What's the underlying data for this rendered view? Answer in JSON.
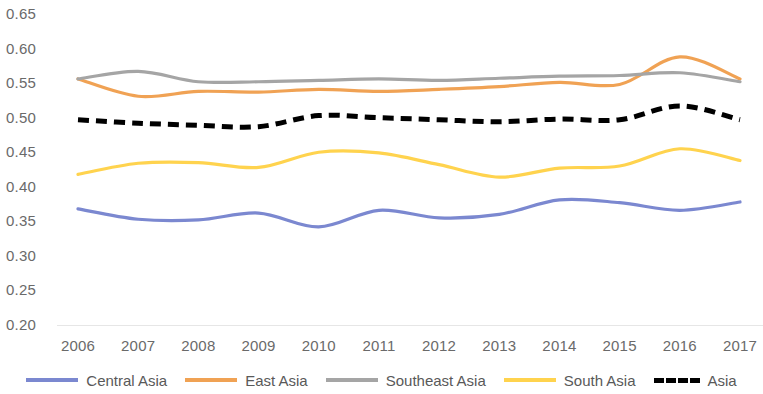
{
  "chart_data": {
    "type": "line",
    "title": "",
    "xlabel": "",
    "ylabel": "",
    "categories": [
      "2006",
      "2007",
      "2008",
      "2009",
      "2010",
      "2011",
      "2012",
      "2013",
      "2014",
      "2015",
      "2016",
      "2017"
    ],
    "x": [
      2006,
      2007,
      2008,
      2009,
      2010,
      2011,
      2012,
      2013,
      2014,
      2015,
      2016,
      2017
    ],
    "ylim": [
      0.2,
      0.65
    ],
    "y_ticks": [
      "0.20",
      "0.25",
      "0.30",
      "0.35",
      "0.40",
      "0.45",
      "0.50",
      "0.55",
      "0.60",
      "0.65"
    ],
    "y_tick_values": [
      0.2,
      0.25,
      0.3,
      0.35,
      0.4,
      0.45,
      0.5,
      0.55,
      0.6,
      0.65
    ],
    "grid": false,
    "legend_position": "bottom",
    "series": [
      {
        "name": "Central Asia",
        "color": "#7B88D0",
        "style": "solid",
        "values": [
          0.368,
          0.353,
          0.352,
          0.362,
          0.342,
          0.366,
          0.355,
          0.36,
          0.381,
          0.377,
          0.366,
          0.378
        ]
      },
      {
        "name": "East Asia",
        "color": "#F0A254",
        "style": "solid",
        "values": [
          0.556,
          0.531,
          0.538,
          0.537,
          0.541,
          0.538,
          0.541,
          0.545,
          0.551,
          0.548,
          0.588,
          0.556
        ]
      },
      {
        "name": "Southeast Asia",
        "color": "#A5A5A5",
        "style": "solid",
        "values": [
          0.556,
          0.567,
          0.552,
          0.552,
          0.554,
          0.556,
          0.554,
          0.557,
          0.56,
          0.561,
          0.565,
          0.552
        ]
      },
      {
        "name": "South Asia",
        "color": "#FFD34E",
        "style": "solid",
        "values": [
          0.418,
          0.434,
          0.435,
          0.428,
          0.45,
          0.449,
          0.432,
          0.414,
          0.427,
          0.43,
          0.455,
          0.438
        ]
      },
      {
        "name": "Asia",
        "color": "#000000",
        "style": "dashed",
        "values": [
          0.497,
          0.492,
          0.489,
          0.487,
          0.503,
          0.5,
          0.497,
          0.494,
          0.498,
          0.497,
          0.517,
          0.497
        ]
      }
    ]
  },
  "axis": {
    "y_labels": [
      "0.65",
      "0.60",
      "0.55",
      "0.50",
      "0.45",
      "0.40",
      "0.35",
      "0.30",
      "0.25",
      "0.20"
    ],
    "x_labels": [
      "2006",
      "2007",
      "2008",
      "2009",
      "2010",
      "2011",
      "2012",
      "2013",
      "2014",
      "2015",
      "2016",
      "2017"
    ]
  },
  "legend": {
    "items": [
      {
        "label": "Central Asia",
        "color": "#7B88D0",
        "style": "solid"
      },
      {
        "label": "East Asia",
        "color": "#F0A254",
        "style": "solid"
      },
      {
        "label": "Southeast Asia",
        "color": "#A5A5A5",
        "style": "solid"
      },
      {
        "label": "South Asia",
        "color": "#FFD34E",
        "style": "solid"
      },
      {
        "label": "Asia",
        "color": "#000000",
        "style": "dashed"
      }
    ]
  }
}
